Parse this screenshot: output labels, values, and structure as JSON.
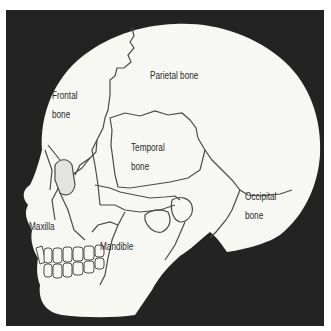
{
  "diagram": {
    "colors": {
      "background": "#232323",
      "bone": "#f7f7f4",
      "outline": "#4a4a4a",
      "text": "#2a2a2a"
    },
    "labels": {
      "frontal": [
        "Frontal",
        "bone"
      ],
      "parietal": "Parietal bone",
      "temporal": [
        "Temporal",
        "bone"
      ],
      "occipital": [
        "Occipital",
        "bone"
      ],
      "maxilla": "Maxilla",
      "mandible": "Mandible"
    }
  }
}
